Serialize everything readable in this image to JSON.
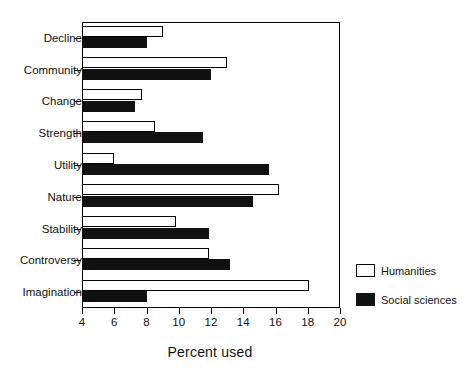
{
  "chart_data": {
    "type": "bar",
    "orientation": "horizontal",
    "title": "",
    "xlabel": "Percent used",
    "ylabel": "",
    "xlim": [
      4,
      20
    ],
    "xticks": [
      4,
      6,
      8,
      10,
      12,
      14,
      16,
      18,
      20
    ],
    "grid": false,
    "legend_position": "right-outside",
    "categories": [
      "Decline",
      "Community",
      "Change",
      "Strength",
      "Utility",
      "Nature",
      "Stability",
      "Controversy",
      "Imagination"
    ],
    "series": [
      {
        "name": "Humanities",
        "color": "#ffffff",
        "edgecolor": "#000000",
        "values": [
          9.0,
          13.0,
          7.7,
          8.5,
          6.0,
          16.2,
          9.8,
          11.9,
          18.1
        ]
      },
      {
        "name": "Social sciences",
        "color": "#111111",
        "edgecolor": "#111111",
        "values": [
          8.0,
          12.0,
          7.3,
          11.5,
          15.6,
          14.6,
          11.9,
          13.2,
          8.0
        ]
      }
    ]
  },
  "legend": {
    "items": [
      {
        "label": "Humanities",
        "swatch": "open-square-swatch"
      },
      {
        "label": "Social sciences",
        "swatch": "filled-square-swatch"
      }
    ]
  },
  "axis": {
    "x_title": "Percent used"
  }
}
